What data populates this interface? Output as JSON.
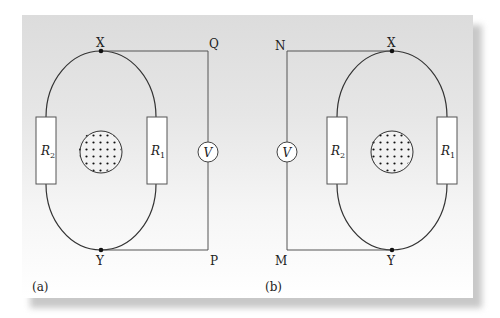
{
  "figure": {
    "panel_a": {
      "label": "(a)",
      "nodes": {
        "top": "X",
        "bottom": "Y",
        "top_right": "Q",
        "bottom_right": "P"
      },
      "resistors": [
        {
          "id": "R2",
          "symbol": "R",
          "subscript": "2",
          "side": "left"
        },
        {
          "id": "R1",
          "symbol": "R",
          "subscript": "1",
          "side": "right"
        }
      ],
      "meter": {
        "symbol": "V",
        "position": "right"
      },
      "field_region": "dots (field out of page)"
    },
    "panel_b": {
      "label": "(b)",
      "nodes": {
        "top": "X",
        "bottom": "Y",
        "top_left": "N",
        "bottom_left": "M"
      },
      "resistors": [
        {
          "id": "R2",
          "symbol": "R",
          "subscript": "2",
          "side": "left"
        },
        {
          "id": "R1",
          "symbol": "R",
          "subscript": "1",
          "side": "right"
        }
      ],
      "meter": {
        "symbol": "V",
        "position": "left"
      },
      "field_region": "dots (field out of page)"
    },
    "colors": {
      "wire": "#333333",
      "resistor_fill": "#ffffff",
      "panel_top": "#dcdcdc",
      "panel_bottom": "#ffffff"
    }
  }
}
